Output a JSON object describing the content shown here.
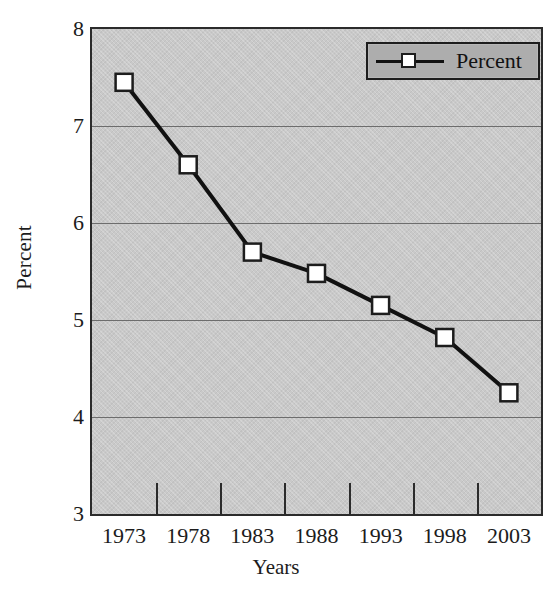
{
  "chart_data": {
    "type": "line",
    "title": "",
    "subtitle": "",
    "xlabel": "Years",
    "ylabel": "Percent",
    "categories": [
      "1973",
      "1978",
      "1983",
      "1988",
      "1993",
      "1998",
      "2003"
    ],
    "series": [
      {
        "name": "Percent",
        "values": [
          7.45,
          6.6,
          5.7,
          5.48,
          5.15,
          4.82,
          4.25
        ]
      }
    ],
    "ylim": [
      3,
      8
    ],
    "yticks": [
      "8",
      "7",
      "6",
      "5",
      "4",
      "3"
    ],
    "ytick_values": [
      8,
      7,
      6,
      5,
      4,
      3
    ],
    "gridlines": [
      7,
      6,
      5,
      4
    ],
    "grid": true,
    "legend": {
      "position": "top-right",
      "entries": [
        "Percent"
      ]
    },
    "marker": "square-open-white",
    "colors": {
      "line": "#111111",
      "marker_fill": "#ffffff",
      "marker_edge": "#1d1d1d",
      "plot_background": "#c9c9c9",
      "legend_background": "#adadad",
      "axis": "#2b2b2b",
      "gridline": "#6d6d6d",
      "text": "#1c1c1c"
    }
  },
  "legend": {
    "label": "Percent"
  },
  "axes": {
    "y_title": "Percent",
    "x_title": "Years"
  }
}
